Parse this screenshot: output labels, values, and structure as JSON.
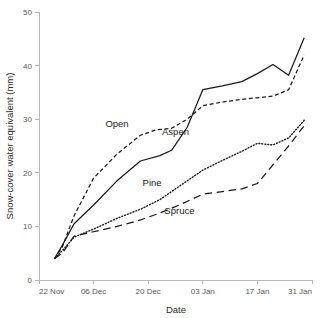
{
  "chart_data": {
    "type": "line",
    "title": "",
    "xlabel": "Date",
    "ylabel": "Snow-cover water equivalent (mm)",
    "xtick_labels": [
      "22 Nov",
      "06 Dec",
      "20 Dec",
      "03 Jan",
      "17 Jan",
      "31 Jan"
    ],
    "xtick_values": [
      0,
      14,
      28,
      42,
      56,
      70
    ],
    "ytick_labels": [
      "0",
      "10",
      "20",
      "30",
      "40",
      "50"
    ],
    "ytick_values": [
      0,
      10,
      20,
      30,
      40,
      50
    ],
    "xlim": [
      0,
      70
    ],
    "ylim": [
      0,
      50
    ],
    "grid": false,
    "legend_position": "inline-annotations",
    "x_unit": "days since 22 Nov",
    "series": [
      {
        "name": "Open",
        "line_style": "dashed",
        "color": "#1a1a1a",
        "label_x": 20,
        "label_y": 28.6,
        "x": [
          4,
          6,
          9,
          14,
          20,
          26,
          30,
          34,
          38,
          42,
          47,
          52,
          56,
          60,
          64,
          68
        ],
        "values": [
          4.0,
          6.2,
          12.0,
          19.0,
          23.5,
          27.0,
          28.0,
          28.3,
          30.0,
          32.5,
          33.2,
          33.7,
          34.0,
          34.3,
          35.5,
          42.0
        ]
      },
      {
        "name": "Aspen",
        "line_style": "solid",
        "color": "#1a1a1a",
        "label_x": 35,
        "label_y": 27.0,
        "x": [
          4,
          6,
          9,
          14,
          20,
          26,
          31,
          34,
          38,
          42,
          47,
          52,
          56,
          60,
          64,
          68
        ],
        "values": [
          4.0,
          6.5,
          10.5,
          14.0,
          18.5,
          22.2,
          23.2,
          24.2,
          28.5,
          35.5,
          36.2,
          37.0,
          38.5,
          40.2,
          38.2,
          45.2
        ]
      },
      {
        "name": "Pine",
        "line_style": "dotted",
        "color": "#1a1a1a",
        "label_x": 29,
        "label_y": 17.6,
        "x": [
          4,
          6,
          9,
          14,
          20,
          26,
          31,
          36,
          42,
          47,
          52,
          56,
          60,
          64,
          68
        ],
        "values": [
          4.0,
          5.5,
          8.0,
          9.5,
          11.5,
          13.2,
          15.0,
          17.5,
          20.5,
          22.3,
          24.0,
          25.5,
          25.2,
          26.5,
          29.8
        ]
      },
      {
        "name": "Spruce",
        "line_style": "long-dashed",
        "color": "#1a1a1a",
        "label_x": 36,
        "label_y": 12.3,
        "x": [
          4,
          6,
          9,
          14,
          20,
          26,
          31,
          36,
          42,
          47,
          52,
          56,
          60,
          64,
          68
        ],
        "values": [
          4.0,
          5.0,
          8.2,
          9.0,
          10.0,
          11.2,
          12.5,
          14.0,
          16.0,
          16.5,
          17.0,
          18.0,
          21.5,
          25.0,
          28.8
        ]
      }
    ]
  }
}
